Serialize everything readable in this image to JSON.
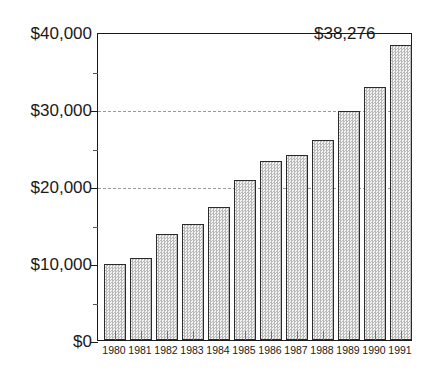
{
  "chart_data": {
    "type": "bar",
    "title": "",
    "subtitle": "",
    "xlabel": "",
    "ylabel": "",
    "categories": [
      "1980",
      "1981",
      "1982",
      "1983",
      "1984",
      "1985",
      "1986",
      "1987",
      "1988",
      "1989",
      "1990",
      "1991"
    ],
    "values": [
      9900,
      10600,
      13800,
      15100,
      17300,
      20800,
      23300,
      24000,
      26000,
      29700,
      32800,
      38276
    ],
    "ylim": [
      0,
      40000
    ],
    "y_major_ticks": [
      0,
      10000,
      20000,
      30000,
      40000
    ],
    "y_minor_ticks": [
      5000,
      15000,
      25000,
      35000
    ],
    "y_tick_labels": [
      "$0",
      "$10,000",
      "$20,000",
      "$30,000",
      "$40,000"
    ],
    "gridlines_at": [
      20000,
      30000
    ],
    "grid": "horizontal-dashed",
    "legend": "none",
    "annotations": [
      {
        "text": "$38,276",
        "for_category": "1991",
        "value": 38276
      }
    ],
    "bar_fill": "#e8e8e8",
    "bar_pattern": "halftone-dot",
    "bar_border_color": "#2b2b2b",
    "axis_color": "#1a1a1a",
    "gridline_color": "#9a9a9a",
    "background": "#ffffff"
  }
}
